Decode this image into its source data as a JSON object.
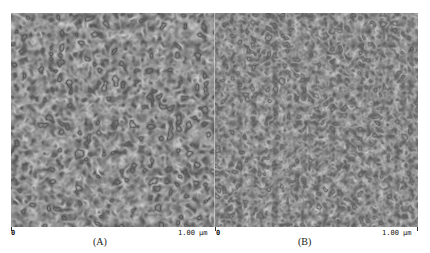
{
  "figure": {
    "panels": [
      {
        "id": "A",
        "label": "(A)",
        "axis_start": "0",
        "axis_end": "1.00 µm",
        "description": "AFM phase image, labyrinthine lamellar morphology, higher contrast"
      },
      {
        "id": "B",
        "label": "(B)",
        "axis_start": "0",
        "axis_end": "1.00 µm",
        "description": "AFM phase image, finer labyrinthine morphology, lower contrast"
      }
    ],
    "colors": {
      "background": "#ffffff",
      "image_dark": "#1a1a1a",
      "image_light": "#c8c8c8",
      "text": "#111111"
    }
  }
}
